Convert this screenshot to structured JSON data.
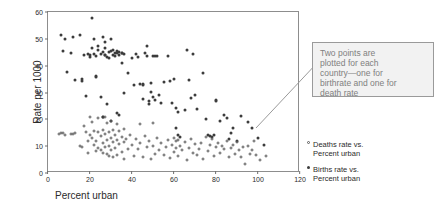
{
  "chart_data": {
    "type": "scatter",
    "title": "",
    "xlabel": "Percent urban",
    "ylabel": "Rate per 1000",
    "xlim": [
      0,
      120
    ],
    "ylim": [
      0,
      60
    ],
    "xticks": [
      0,
      20,
      40,
      60,
      80,
      100,
      120
    ],
    "yticks": [
      0,
      10,
      20,
      30,
      40,
      50,
      60
    ],
    "grid": false,
    "legend_position": "right",
    "annotation": "Two points are\nplotted for each\ncountry—one for\nbirthrate and one for\ndeath rate",
    "series": [
      {
        "name": "Births rate vs. Percent urban",
        "marker": "filled-circle",
        "color": "#3c3c3c",
        "points": [
          [
            6,
            51.5
          ],
          [
            7,
            45.5
          ],
          [
            8,
            50
          ],
          [
            9,
            37.8
          ],
          [
            11,
            44.6
          ],
          [
            12,
            50.8
          ],
          [
            13,
            34.6
          ],
          [
            15,
            51.5
          ],
          [
            16,
            35.2
          ],
          [
            16,
            34.4
          ],
          [
            17,
            43.8
          ],
          [
            18,
            28.8
          ],
          [
            19,
            44.4
          ],
          [
            20,
            43.4
          ],
          [
            20,
            44.1
          ],
          [
            21,
            57.6
          ],
          [
            21,
            46.4
          ],
          [
            22,
            44.3
          ],
          [
            22,
            49.8
          ],
          [
            23,
            43.5
          ],
          [
            23,
            36.0
          ],
          [
            23,
            35.9
          ],
          [
            24,
            45.8
          ],
          [
            24,
            47.4
          ],
          [
            25,
            44.2
          ],
          [
            25,
            28.2
          ],
          [
            26,
            45.2
          ],
          [
            26,
            50.6
          ],
          [
            26,
            20.8
          ],
          [
            26,
            21.0
          ],
          [
            27,
            44.1
          ],
          [
            27,
            46.4
          ],
          [
            27,
            43.8
          ],
          [
            27,
            48.9
          ],
          [
            28,
            43.2
          ],
          [
            28,
            25.8
          ],
          [
            29,
            45.0
          ],
          [
            29,
            42.8
          ],
          [
            30,
            45.4
          ],
          [
            30,
            49.9
          ],
          [
            30,
            19.5
          ],
          [
            31,
            44.0
          ],
          [
            31,
            46.0
          ],
          [
            32,
            44.6
          ],
          [
            32,
            43.6
          ],
          [
            33,
            45.4
          ],
          [
            33,
            44.8
          ],
          [
            33,
            22.4
          ],
          [
            34,
            44.0
          ],
          [
            34,
            45.2
          ],
          [
            34,
            21.6
          ],
          [
            35,
            44.8
          ],
          [
            35,
            44.9
          ],
          [
            35,
            41.0
          ],
          [
            36,
            44.2
          ],
          [
            36,
            29.9
          ],
          [
            38,
            37.4
          ],
          [
            40,
            43.0
          ],
          [
            41,
            32.8
          ],
          [
            42,
            44.5
          ],
          [
            43,
            43.2
          ],
          [
            44,
            33.0
          ],
          [
            45,
            33.1
          ],
          [
            45,
            32.9
          ],
          [
            45,
            27.6
          ],
          [
            46,
            44.9
          ],
          [
            47,
            47.4
          ],
          [
            47,
            43.6
          ],
          [
            48,
            25.9
          ],
          [
            48,
            26.8
          ],
          [
            49,
            33.5
          ],
          [
            49,
            30.2
          ],
          [
            50,
            43.6
          ],
          [
            50,
            28.4
          ],
          [
            51,
            43.6
          ],
          [
            51,
            27.2
          ],
          [
            52,
            43.5
          ],
          [
            53,
            29.0
          ],
          [
            54,
            26.2
          ],
          [
            55,
            33.8
          ],
          [
            57,
            43.5
          ],
          [
            58,
            34.2
          ],
          [
            59,
            26.0
          ],
          [
            60,
            35.0
          ],
          [
            61,
            24.2
          ],
          [
            61,
            16.8
          ],
          [
            62,
            22.8
          ],
          [
            62,
            14.0
          ],
          [
            63,
            13.6
          ],
          [
            65,
            23.6
          ],
          [
            66,
            45.8
          ],
          [
            67,
            34.8
          ],
          [
            68,
            27.9
          ],
          [
            69,
            44.2
          ],
          [
            70,
            29.0
          ],
          [
            71,
            24.0
          ],
          [
            74,
            37.2
          ],
          [
            75,
            20.0
          ],
          [
            76,
            14.2
          ],
          [
            77,
            13.8
          ],
          [
            78,
            13.6
          ],
          [
            79,
            14.0
          ],
          [
            80,
            27.2
          ],
          [
            80,
            27.0
          ],
          [
            82,
            19.4
          ],
          [
            84,
            21.6
          ],
          [
            85,
            20.4
          ],
          [
            86,
            12.6
          ],
          [
            87,
            14.8
          ],
          [
            88,
            16.8
          ],
          [
            90,
            11.8
          ],
          [
            92,
            21.4
          ],
          [
            95,
            19.0
          ],
          [
            97,
            16.6
          ],
          [
            100,
            13.2
          ],
          [
            103,
            10.5
          ]
        ]
      },
      {
        "name": "Deaths rate vs. Percent urban",
        "marker": "open-circle",
        "color": "#5a5a5a",
        "points": [
          [
            5,
            14.6
          ],
          [
            6,
            15.0
          ],
          [
            7,
            14.8
          ],
          [
            8,
            14.2
          ],
          [
            11,
            14.7
          ],
          [
            12,
            14.6
          ],
          [
            13,
            14.8
          ],
          [
            15,
            10.2
          ],
          [
            16,
            9.8
          ],
          [
            17,
            17.4
          ],
          [
            18,
            15.2
          ],
          [
            19,
            11.8
          ],
          [
            19,
            7.6
          ],
          [
            20,
            20.8
          ],
          [
            20,
            14.0
          ],
          [
            21,
            19.0
          ],
          [
            21,
            13.2
          ],
          [
            22,
            15.6
          ],
          [
            22,
            10.6
          ],
          [
            23,
            12.0
          ],
          [
            23,
            8.2
          ],
          [
            24,
            20.6
          ],
          [
            24,
            15.2
          ],
          [
            24,
            9.2
          ],
          [
            25,
            13.8
          ],
          [
            25,
            8.4
          ],
          [
            26,
            16.0
          ],
          [
            26,
            11.0
          ],
          [
            26,
            7.4
          ],
          [
            27,
            21.0
          ],
          [
            27,
            14.6
          ],
          [
            27,
            9.8
          ],
          [
            28,
            18.8
          ],
          [
            28,
            12.4
          ],
          [
            28,
            7.0
          ],
          [
            29,
            15.4
          ],
          [
            29,
            10.0
          ],
          [
            29,
            6.2
          ],
          [
            30,
            19.2
          ],
          [
            30,
            13.0
          ],
          [
            30,
            8.6
          ],
          [
            31,
            16.2
          ],
          [
            31,
            11.4
          ],
          [
            31,
            5.8
          ],
          [
            32,
            14.0
          ],
          [
            32,
            9.4
          ],
          [
            33,
            18.2
          ],
          [
            33,
            12.2
          ],
          [
            33,
            6.8
          ],
          [
            34,
            15.8
          ],
          [
            34,
            10.8
          ],
          [
            35,
            13.4
          ],
          [
            35,
            8.0
          ],
          [
            36,
            16.4
          ],
          [
            36,
            11.6
          ],
          [
            36,
            5.4
          ],
          [
            37,
            12.8
          ],
          [
            38,
            9.0
          ],
          [
            39,
            14.2
          ],
          [
            40,
            10.4
          ],
          [
            41,
            6.4
          ],
          [
            42,
            12.6
          ],
          [
            43,
            8.8
          ],
          [
            44,
            18.4
          ],
          [
            44,
            11.2
          ],
          [
            45,
            6.0
          ],
          [
            46,
            13.8
          ],
          [
            47,
            9.6
          ],
          [
            48,
            12.0
          ],
          [
            49,
            5.2
          ],
          [
            50,
            18.6
          ],
          [
            50,
            10.2
          ],
          [
            51,
            7.2
          ],
          [
            52,
            13.2
          ],
          [
            53,
            8.4
          ],
          [
            54,
            11.0
          ],
          [
            55,
            6.6
          ],
          [
            56,
            9.8
          ],
          [
            57,
            12.4
          ],
          [
            58,
            5.6
          ],
          [
            59,
            10.6
          ],
          [
            60,
            13.0
          ],
          [
            60,
            7.8
          ],
          [
            61,
            11.8
          ],
          [
            61,
            9.2
          ],
          [
            62,
            12.2
          ],
          [
            62,
            6.2
          ],
          [
            63,
            10.0
          ],
          [
            64,
            8.6
          ],
          [
            65,
            11.4
          ],
          [
            66,
            5.0
          ],
          [
            67,
            9.4
          ],
          [
            68,
            12.6
          ],
          [
            69,
            7.4
          ],
          [
            70,
            10.8
          ],
          [
            71,
            6.8
          ],
          [
            72,
            9.0
          ],
          [
            73,
            11.2
          ],
          [
            74,
            5.4
          ],
          [
            75,
            13.4
          ],
          [
            76,
            8.2
          ],
          [
            77,
            10.4
          ],
          [
            78,
            12.8
          ],
          [
            79,
            6.4
          ],
          [
            80,
            9.6
          ],
          [
            81,
            11.0
          ],
          [
            82,
            7.6
          ],
          [
            83,
            10.2
          ],
          [
            84,
            8.8
          ],
          [
            85,
            12.0
          ],
          [
            86,
            6.0
          ],
          [
            87,
            9.2
          ],
          [
            88,
            10.6
          ],
          [
            89,
            7.2
          ],
          [
            90,
            11.6
          ],
          [
            91,
            8.4
          ],
          [
            92,
            5.8
          ],
          [
            93,
            9.8
          ],
          [
            94,
            3.4
          ],
          [
            95,
            10.0
          ],
          [
            96,
            7.0
          ],
          [
            97,
            8.6
          ],
          [
            98,
            11.8
          ],
          [
            99,
            6.6
          ],
          [
            101,
            4.8
          ],
          [
            104,
            6.2
          ]
        ]
      }
    ]
  },
  "legend": {
    "entries": [
      {
        "marker": "open-circle",
        "label": "Deaths rate vs.\nPercent urban"
      },
      {
        "marker": "filled-circle",
        "label": "Births rate vs.\nPercent urban"
      }
    ]
  },
  "colors": {
    "births_marker": "#3c3c3c",
    "deaths_marker": "#5a5a5a",
    "frame": "#8d8d8d",
    "callout_fill": "#f2f2f2",
    "callout_border": "#9a9a9a",
    "callout_text": "#808080"
  }
}
